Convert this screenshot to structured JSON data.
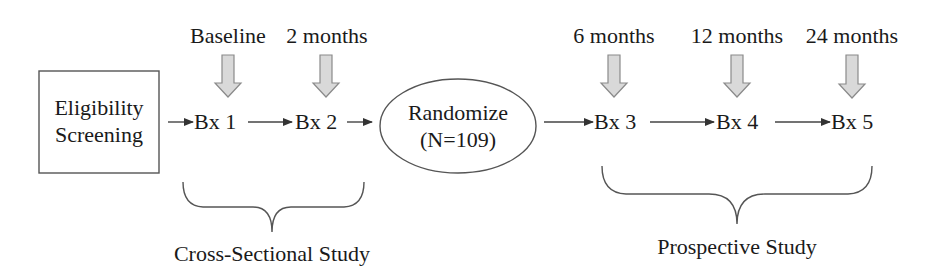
{
  "diagram": {
    "type": "study-timeline-flowchart",
    "start": {
      "label_line1": "Eligibility",
      "label_line2": "Screening",
      "shape": "rectangle"
    },
    "randomize": {
      "label_line1": "Randomize",
      "label_line2": "(N=109)",
      "shape": "ellipse"
    },
    "biopsies": [
      {
        "label": "Bx 1",
        "timepoint": "Baseline"
      },
      {
        "label": "Bx 2",
        "timepoint": "2 months"
      },
      {
        "label": "Bx 3",
        "timepoint": "6 months"
      },
      {
        "label": "Bx 4",
        "timepoint": "12 months"
      },
      {
        "label": "Bx 5",
        "timepoint": "24 months"
      }
    ],
    "groups": [
      {
        "label": "Cross-Sectional Study",
        "covers": [
          "Bx 1",
          "Bx 2"
        ]
      },
      {
        "label": "Prospective Study",
        "covers": [
          "Bx 3",
          "Bx 4",
          "Bx 5"
        ]
      }
    ],
    "flow": [
      "Eligibility Screening",
      "Bx 1",
      "Bx 2",
      "Randomize (N=109)",
      "Bx 3",
      "Bx 4",
      "Bx 5"
    ],
    "colors": {
      "line": "#444444",
      "block_arrow_fill": "#d9d9d9",
      "block_arrow_stroke": "#8a8a8a",
      "text": "#1a1a1a"
    }
  }
}
